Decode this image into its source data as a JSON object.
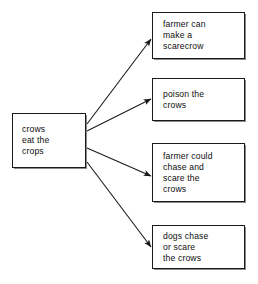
{
  "diagram": {
    "type": "concept-map",
    "line_color": "#1a1a1a",
    "box_border_color": "#1a1a1a",
    "box_fill_color": "#ffffff",
    "background_color": "#ffffff",
    "source": {
      "id": "source",
      "label": "crows\neat the\ncrops"
    },
    "targets": [
      {
        "id": "target-0",
        "label": "farmer can\nmake a\nscarecrow"
      },
      {
        "id": "target-1",
        "label": "poison the\ncrows"
      },
      {
        "id": "target-2",
        "label": "farmer could\nchase and\nscare the\ncrows"
      },
      {
        "id": "target-3",
        "label": "dogs chase\nor scare\nthe crows"
      }
    ],
    "connections": [
      {
        "from": "source",
        "to": "target-0",
        "style": "arrow"
      },
      {
        "from": "source",
        "to": "target-1",
        "style": "arrow"
      },
      {
        "from": "source",
        "to": "target-2",
        "style": "arrow"
      },
      {
        "from": "source",
        "to": "target-3",
        "style": "arrow"
      }
    ]
  }
}
